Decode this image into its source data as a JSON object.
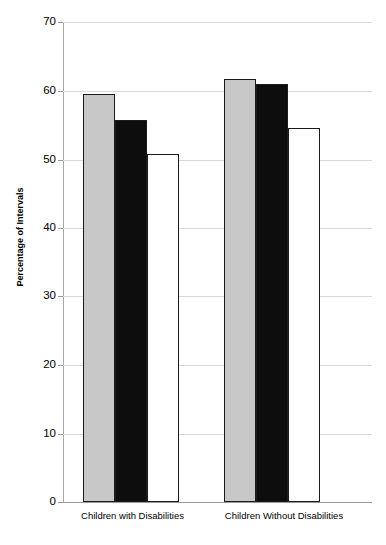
{
  "chart_data": {
    "type": "bar",
    "title": "",
    "subtitle": "",
    "xlabel": "",
    "ylabel": "Percentage of Intervals",
    "categories": [
      "Children with Disabilities",
      "Children Without Disabilities"
    ],
    "series": [
      {
        "name": "Series 1",
        "color": "#c8c8c8",
        "style": "gray-filled",
        "values": [
          59.5,
          61.7
        ]
      },
      {
        "name": "Series 2",
        "color": "#0d0d0d",
        "style": "black-filled",
        "values": [
          55.7,
          61.0
        ]
      },
      {
        "name": "Series 3",
        "color": "#ffffff",
        "style": "white-open",
        "values": [
          50.8,
          54.6
        ]
      }
    ],
    "ylim": [
      0,
      70
    ],
    "yticks": [
      0,
      10,
      20,
      30,
      40,
      50,
      60,
      70
    ],
    "ytick_labels": [
      "0",
      "10",
      "20",
      "30",
      "40",
      "50",
      "60",
      "70"
    ],
    "grid": true,
    "grid_axis": "y",
    "legend": false,
    "legend_position": "none",
    "annotations": []
  },
  "axis": {
    "y_title": "Percentage of Intervals",
    "tick_0": "0",
    "tick_10": "10",
    "tick_20": "20",
    "tick_30": "30",
    "tick_40": "40",
    "tick_50": "50",
    "tick_60": "60",
    "tick_70": "70"
  },
  "categories": {
    "group_1": "Children with Disabilities",
    "group_2": "Children Without Disabilities"
  }
}
